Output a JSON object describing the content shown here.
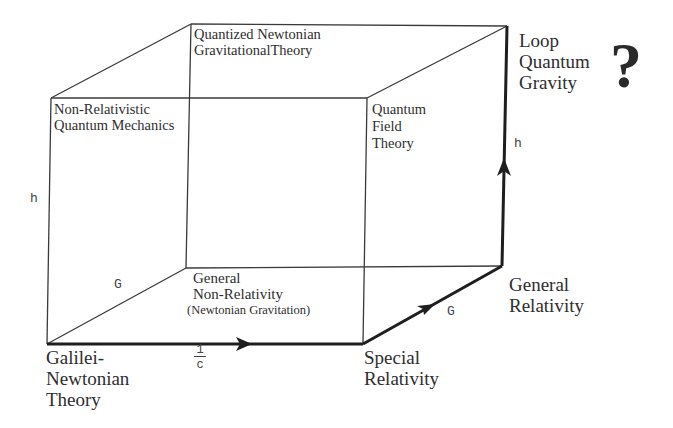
{
  "diagram": {
    "type": "cube-of-physical-theories",
    "colors": {
      "line": "#3a3a3a",
      "path": "#1e1e1e",
      "text": "#2e2e2e"
    },
    "vertices": {
      "front_bottom_left": "Galilei-\nNewtonian\nTheory",
      "front_bottom_right": "Special\nRelativity",
      "back_bottom_left": "General\nNon-Relativity",
      "back_bottom_left_sub": "(Newtonian Gravitation)",
      "back_bottom_right": "General\nRelativity",
      "front_top_left": "Non-Relativistic\nQuantum Mechanics",
      "front_top_right": "Quantum\nField\nTheory",
      "back_top_left": "Quantized Newtonian\nGravitationalTheory",
      "back_top_right": "Loop\nQuantum\nGravity",
      "back_top_right_mark": "?"
    },
    "axes": {
      "h_left": "h",
      "G_left": "G",
      "inv_c_numerator": "1",
      "inv_c_denominator": "c",
      "G_path": "G",
      "h_path": "h"
    }
  }
}
